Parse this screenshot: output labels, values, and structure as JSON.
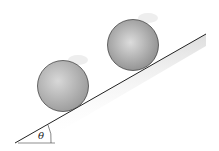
{
  "diagram": {
    "angle_label": "θ",
    "objects": [
      "sphere-small",
      "sphere-large",
      "incline-plane"
    ]
  }
}
